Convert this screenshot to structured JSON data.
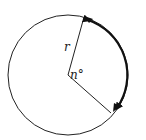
{
  "diagram": {
    "title": "",
    "labels": {
      "radius": "r",
      "angle": "n°"
    },
    "geometry": {
      "center": [
        68,
        75
      ],
      "radius": 60,
      "radius_end_top": [
        84,
        17
      ],
      "radius_end_bottom": [
        111,
        113
      ]
    },
    "colors": {
      "stroke": "#222222",
      "arc": "#111111",
      "background": "#ffffff"
    }
  }
}
